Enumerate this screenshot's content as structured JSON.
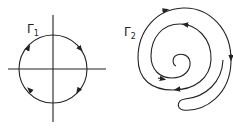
{
  "figure": {
    "left": {
      "label": "Γ",
      "subscript": "1",
      "shape": "circle with crossing axes",
      "orientation": "clockwise arrows"
    },
    "right": {
      "label": "Γ",
      "subscript": "2",
      "shape": "closed spiral contour",
      "orientation": "arrows along spiral"
    },
    "colors": {
      "stroke": "#222222",
      "background": "#ffffff"
    }
  }
}
